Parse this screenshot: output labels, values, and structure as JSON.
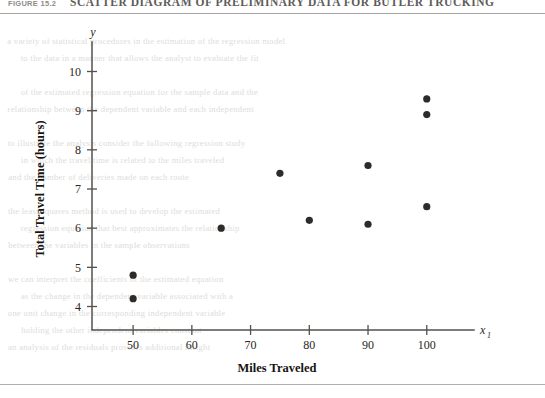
{
  "figure": {
    "number": "FIGURE 15.2",
    "title": "SCATTER DIAGRAM OF PRELIMINARY DATA FOR BUTLER TRUCKING"
  },
  "chart_data": {
    "type": "scatter",
    "title": "SCATTER DIAGRAM OF PRELIMINARY DATA FOR BUTLER TRUCKING",
    "xlabel": "Miles Traveled",
    "ylabel": "Total Travel Time (hours)",
    "x_axis_name": "x",
    "x_axis_subscript": "1",
    "y_axis_name": "y",
    "xlim": [
      43,
      106
    ],
    "ylim": [
      3.4,
      10.6
    ],
    "xticks": [
      50,
      60,
      70,
      80,
      90,
      100
    ],
    "yticks": [
      4,
      5,
      6,
      7,
      8,
      9,
      10
    ],
    "grid": false,
    "legend": "none",
    "point_color": "#2e2b28",
    "points": [
      {
        "x": 50,
        "y": 4.8
      },
      {
        "x": 50,
        "y": 4.2
      },
      {
        "x": 65,
        "y": 6.0
      },
      {
        "x": 75,
        "y": 7.4
      },
      {
        "x": 80,
        "y": 6.2
      },
      {
        "x": 90,
        "y": 7.6
      },
      {
        "x": 90,
        "y": 6.1
      },
      {
        "x": 100,
        "y": 9.3
      },
      {
        "x": 100,
        "y": 8.9
      },
      {
        "x": 100,
        "y": 6.55
      }
    ]
  },
  "ghost_text": {
    "lines": [
      "a variety of statistical procedures in the estimation of the regression model",
      "to the data in a manner that allows the analyst to evaluate the fit",
      "",
      "of the estimated regression equation for the sample data and the",
      "relationship between the dependent variable and each independent",
      "",
      "to illustrate the analysis consider the following regression study",
      "in which the travel time is related to the miles traveled",
      "and the number of deliveries made on each route",
      "",
      "the least squares method is used to develop the estimated",
      "regression equation that best approximates the relationship",
      "between the variables in the sample observations",
      "",
      "we can interpret the coefficients of the estimated equation",
      "as the change in the dependent variable associated with a",
      "one unit change in the corresponding independent variable",
      "holding the other independent variables constant",
      "an analysis of the residuals provides additional insight"
    ]
  }
}
